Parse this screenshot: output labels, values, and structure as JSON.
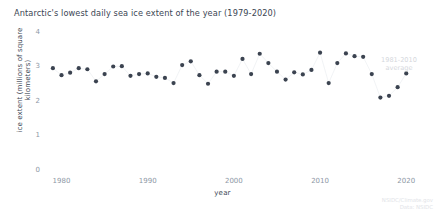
{
  "chart_data": {
    "type": "scatter",
    "title": "Antarctic's lowest daily sea ice extent of the year (1979-2020)",
    "xlabel": "year",
    "ylabel": "ice extent (millions of square kilometers)",
    "xlim": [
      1978.2,
      2020.9
    ],
    "ylim": [
      0,
      4
    ],
    "xticks": [
      1980,
      1990,
      2000,
      2010,
      2020
    ],
    "yticks": [
      0,
      1,
      2,
      3,
      4
    ],
    "grid": false,
    "legend": "none",
    "marker_color": "#3b4350",
    "connector_color": "#eef0f2",
    "annotation": {
      "line1": "1981-2010",
      "line2": "average",
      "color": "#d5d8dd"
    },
    "credit": {
      "line1": "NSIDC/Climate.gov",
      "line2": "Data: NSIDC"
    },
    "x": [
      1979,
      1980,
      1981,
      1982,
      1983,
      1984,
      1985,
      1986,
      1987,
      1988,
      1989,
      1990,
      1991,
      1992,
      1993,
      1994,
      1995,
      1996,
      1997,
      1998,
      1999,
      2000,
      2001,
      2002,
      2003,
      2004,
      2005,
      2006,
      2007,
      2008,
      2009,
      2010,
      2011,
      2012,
      2013,
      2014,
      2015,
      2016,
      2017,
      2018,
      2019,
      2020
    ],
    "values": [
      2.95,
      2.75,
      2.82,
      2.95,
      2.92,
      2.57,
      2.78,
      3.0,
      3.01,
      2.73,
      2.78,
      2.8,
      2.7,
      2.67,
      2.52,
      3.04,
      3.15,
      2.75,
      2.5,
      2.85,
      2.85,
      2.73,
      3.22,
      2.78,
      3.37,
      3.1,
      2.85,
      2.62,
      2.83,
      2.77,
      2.9,
      3.4,
      2.52,
      3.1,
      3.38,
      3.3,
      3.28,
      2.78,
      2.1,
      2.15,
      2.4,
      2.8
    ]
  }
}
